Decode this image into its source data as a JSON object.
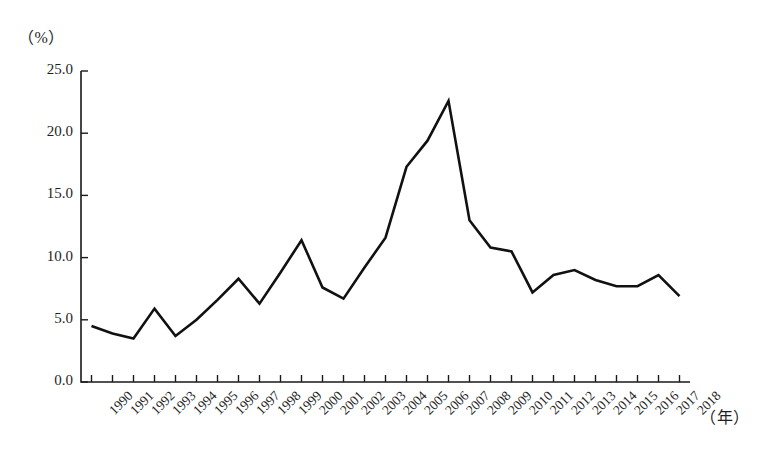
{
  "chart_data": {
    "type": "line",
    "title": "",
    "subtitle": "",
    "xlabel": "（年）",
    "ylabel": "（%）",
    "x": [
      1990,
      1991,
      1992,
      1993,
      1994,
      1995,
      1996,
      1997,
      1998,
      1999,
      2000,
      2001,
      2002,
      2003,
      2004,
      2005,
      2006,
      2007,
      2008,
      2009,
      2010,
      2011,
      2012,
      2013,
      2014,
      2015,
      2016,
      2017,
      2018
    ],
    "categories": [
      "1990",
      "1991",
      "1992",
      "1993",
      "1994",
      "1995",
      "1996",
      "1997",
      "1998",
      "1999",
      "2000",
      "2001",
      "2002",
      "2003",
      "2004",
      "2005",
      "2006",
      "2007",
      "2008",
      "2009",
      "2010",
      "2011",
      "2012",
      "2013",
      "2014",
      "2015",
      "2016",
      "2017",
      "2018"
    ],
    "values": [
      4.5,
      3.9,
      3.5,
      5.9,
      3.7,
      5.0,
      6.6,
      8.3,
      6.3,
      8.8,
      11.4,
      7.6,
      6.7,
      9.2,
      11.6,
      17.3,
      19.4,
      22.6,
      13.0,
      10.8,
      10.5,
      7.2,
      8.6,
      9.0,
      8.2,
      7.7,
      7.7,
      8.6,
      6.9
    ],
    "series": [
      {
        "name": "",
        "values": [
          4.5,
          3.9,
          3.5,
          5.9,
          3.7,
          5.0,
          6.6,
          8.3,
          6.3,
          8.8,
          11.4,
          7.6,
          6.7,
          9.2,
          11.6,
          17.3,
          19.4,
          22.6,
          13.0,
          10.8,
          10.5,
          7.2,
          8.6,
          9.0,
          8.2,
          7.7,
          7.7,
          8.6,
          6.9
        ],
        "color": "#111111"
      }
    ],
    "ytick_labels": [
      "25.0",
      "20.0",
      "15.0",
      "10.0",
      "5.0",
      "0.0"
    ],
    "ytick_values": [
      25.0,
      20.0,
      15.0,
      10.0,
      5.0,
      0.0
    ],
    "ylim": [
      0.0,
      25.0
    ],
    "xlim": [
      1990,
      2018
    ],
    "grid": false,
    "legend": false,
    "legend_position": "none",
    "line_color": "#111111",
    "axis_color": "#1a1a1a",
    "background": "#ffffff"
  }
}
